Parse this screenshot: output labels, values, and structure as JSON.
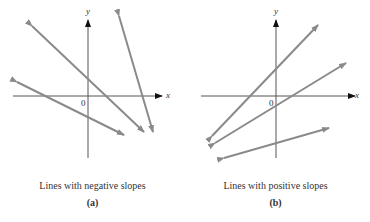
{
  "panels": [
    {
      "id": "a",
      "caption": "Lines with negative slopes",
      "label": "(a)",
      "x_axis_label": "x",
      "y_axis_label": "y",
      "origin_label": "0"
    },
    {
      "id": "b",
      "caption": "Lines with positive slopes",
      "label": "(b)",
      "x_axis_label": "x",
      "y_axis_label": "y",
      "origin_label": "0"
    }
  ],
  "colors": {
    "line": "#8a8a8a",
    "axis": "#333333"
  }
}
